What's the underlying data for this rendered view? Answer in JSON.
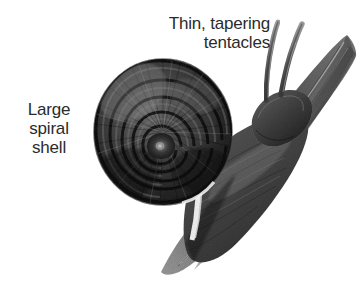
{
  "figure": {
    "kind": "natural-history-illustration",
    "medium": "pencil / charcoal shading",
    "background_color": "#ffffff",
    "ink_color": "#2b2b2b"
  },
  "labels": {
    "tentacles": {
      "text": "Thin, tapering\ntentacles",
      "align": "right"
    },
    "shell": {
      "text": "Large\nspiral\nshell",
      "align": "center"
    }
  },
  "parts": [
    {
      "name": "spiral-shell",
      "description": "large flat coiled shell with concentric whorls"
    },
    {
      "name": "tentacle-upper",
      "description": "thin tapering tentacle"
    },
    {
      "name": "tentacle-lower",
      "description": "thin tapering tentacle"
    },
    {
      "name": "head",
      "description": "rounded head of the snail"
    },
    {
      "name": "foot",
      "description": "muscular foot gripping the leaf"
    },
    {
      "name": "leaf-blade",
      "description": "diagonal grass-like leaf blade"
    }
  ]
}
